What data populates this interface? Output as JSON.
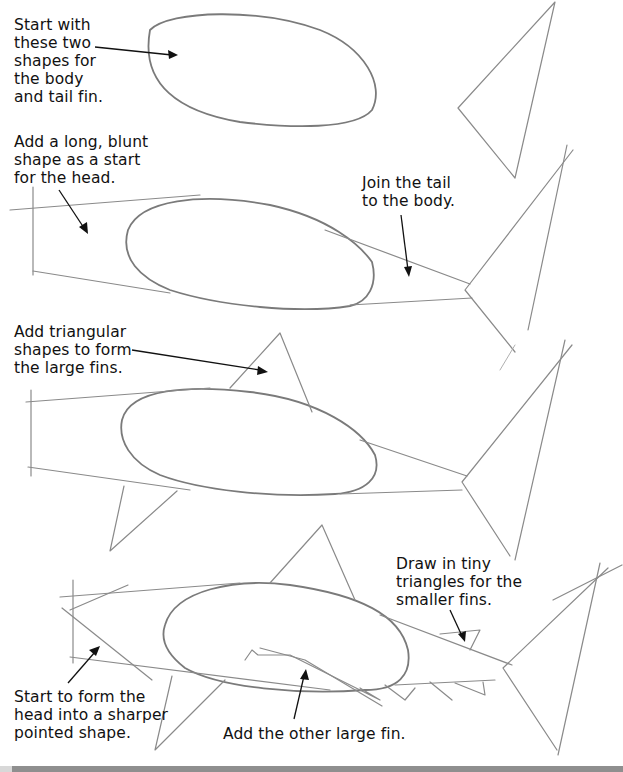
{
  "page": {
    "topic": "How to draw a shark - step by step",
    "background": "#ffffff",
    "pencil_color": "#8a8a8a",
    "text_color": "#111111"
  },
  "steps": [
    {
      "step": 1,
      "caption": "Start with\nthese two\nshapes for\nthe body\nand tail fin."
    },
    {
      "step": 2,
      "caption": "Add a long, blunt\nshape as a start\nfor the head.",
      "caption_2": "Join the tail\nto the body."
    },
    {
      "step": 3,
      "caption": "Add triangular\nshapes to form\nthe large fins."
    },
    {
      "step": 4,
      "caption": "Draw in tiny\ntriangles for the\nsmaller fins.",
      "caption_2": "Start to form the\nhead into a sharper\npointed shape.",
      "caption_3": "Add the other large fin."
    }
  ]
}
